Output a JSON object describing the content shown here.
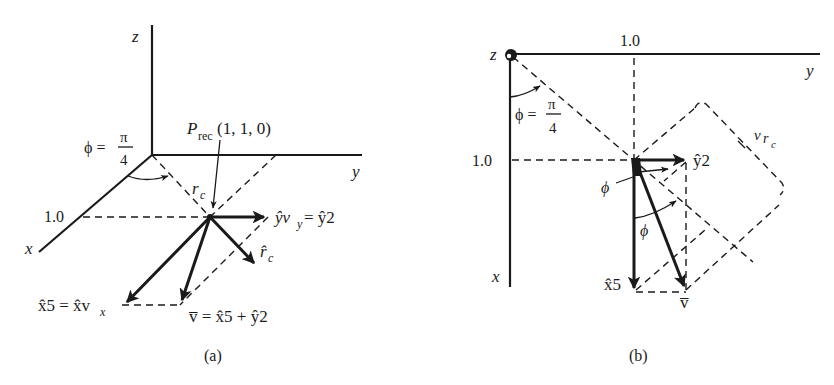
{
  "figure_a": {
    "caption": "(a)",
    "axes": {
      "z": "z",
      "y": "y",
      "x": "x"
    },
    "tick_x": "1.0",
    "phi_label": "ϕ =",
    "phi_num": "π",
    "phi_den": "4",
    "point_P": "P",
    "point_sub": "rec",
    "point_coords": "(1, 1, 0)",
    "rc_label": "r",
    "rc_sub": "c",
    "rc_hat_label": "r̂",
    "rc_hat_sub": "c",
    "yv_label_left": "ŷv",
    "yv_label_sub": "y",
    "yv_label_right": " = ŷ2",
    "xv_label_left": "x̂5 = x̂v",
    "xv_label_sub": "x",
    "v_sum_label": "v̅ = x̂5 + ŷ2"
  },
  "figure_b": {
    "caption": "(b)",
    "axes": {
      "z": "z",
      "y": "y",
      "x": "x"
    },
    "tick_y": "1.0",
    "tick_x": "1.0",
    "phi_label": "ϕ =",
    "phi_num": "π",
    "phi_den": "4",
    "phi_small_1": "ϕ",
    "phi_small_2": "ϕ",
    "y2_label": "ŷ2",
    "x5_label": "x̂5",
    "v_label": "v̅",
    "vrc_label": "v",
    "vrc_r": "r",
    "vrc_sub": "c"
  }
}
